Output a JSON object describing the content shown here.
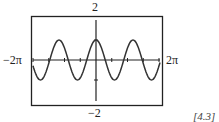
{
  "chart_data": {
    "type": "line",
    "title": "",
    "xlabel": "",
    "ylabel": "",
    "xlim": [
      "-2π",
      "2π"
    ],
    "ylim": [
      -2,
      2
    ],
    "x_tick_labels": {
      "left": "−2π",
      "right": "2π"
    },
    "y_tick_labels": {
      "top": "2",
      "bottom": "−2"
    },
    "x_tick_step": "π/2",
    "y_tick_step": 1,
    "grid": false,
    "legend": null,
    "annotation": "[4.3]",
    "series": [
      {
        "name": "curve",
        "description": "cosine-like wave, amplitude 1, peak at x=0, period ≈ 1.17π (≈ 3.4 cycles across the window)",
        "amplitude": 1,
        "period_radians": 3.69,
        "x": [
          -6.28,
          -5.54,
          -4.62,
          -3.69,
          -2.77,
          -1.85,
          -0.92,
          0,
          0.92,
          1.85,
          2.77,
          3.69,
          4.62,
          5.54,
          6.28
        ],
        "y": [
          -0.3,
          -1,
          0,
          1,
          0,
          -1,
          0,
          1,
          0,
          -1,
          0,
          1,
          0,
          -1,
          -0.3
        ]
      }
    ],
    "colors": {
      "curve": "#333333",
      "axes": "#222222",
      "frame": "#222222"
    }
  },
  "labels": {
    "top": "2",
    "bottom": "−2",
    "left": "−2π",
    "right": "2π",
    "reference": "[4.3]"
  }
}
